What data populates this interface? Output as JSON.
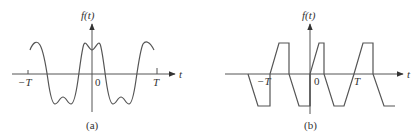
{
  "figure": {
    "panels": [
      {
        "id": "a",
        "caption": "(a)",
        "y_label": "f(t)",
        "x_label": "t",
        "ticks": {
          "neg_T": "−T",
          "zero": "0",
          "T": "T"
        },
        "description": "Smooth periodic waveform with dips at peaks and troughs (sum of fundamental and third harmonic), even symmetry"
      },
      {
        "id": "b",
        "caption": "(b)",
        "y_label": "f(t)",
        "x_label": "t",
        "ticks": {
          "neg_T": "−T",
          "zero": "0",
          "T": "T"
        },
        "description": "Piecewise-linear periodic waveform: ramp up, flat top, vertical drop, ramp down, flat bottom, vertical rise"
      }
    ]
  }
}
